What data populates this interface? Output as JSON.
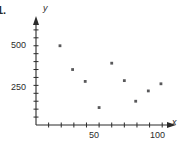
{
  "question_number": "1.",
  "axes": {
    "x_label": "x",
    "y_label": "y",
    "x_ticklabels": [
      "50",
      "100"
    ],
    "y_ticklabels": [
      "250",
      "500"
    ]
  },
  "colors": {
    "axis": "#2b2b2b",
    "marker": "#58585a",
    "text": "#2b2b2b",
    "background": "#ffffff"
  },
  "chart_data": {
    "type": "scatter",
    "title": "",
    "subtitle": "",
    "xlabel": "x",
    "ylabel": "y",
    "xlim": [
      0,
      110
    ],
    "ylim": [
      0,
      620
    ],
    "xticks": [
      10,
      20,
      30,
      40,
      50,
      60,
      70,
      80,
      90,
      100
    ],
    "yticks": [
      50,
      100,
      150,
      200,
      250,
      300,
      350,
      400,
      450,
      500,
      550,
      600
    ],
    "xticklabels": {
      "50": "50",
      "100": "100"
    },
    "yticklabels": {
      "250": "250",
      "500": "500"
    },
    "grid": false,
    "legend": null,
    "series": [
      {
        "name": "data",
        "marker": "square",
        "points": [
          {
            "x": 19,
            "y": 500
          },
          {
            "x": 29,
            "y": 350
          },
          {
            "x": 39,
            "y": 275
          },
          {
            "x": 50,
            "y": 110
          },
          {
            "x": 60,
            "y": 390
          },
          {
            "x": 70,
            "y": 280
          },
          {
            "x": 79,
            "y": 150
          },
          {
            "x": 89,
            "y": 215
          },
          {
            "x": 99,
            "y": 260
          }
        ]
      }
    ]
  }
}
